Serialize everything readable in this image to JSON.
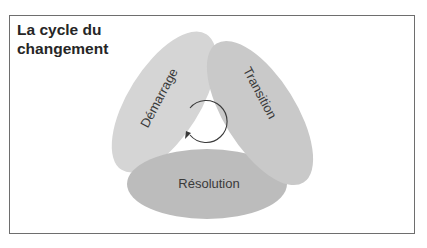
{
  "title": {
    "line1": "La cycle du",
    "line2": "changement"
  },
  "diagram": {
    "phases": [
      {
        "label": "Démarrage",
        "color": "#d5d5d5"
      },
      {
        "label": "Transition",
        "color": "#c9c9c9"
      },
      {
        "label": "Résolution",
        "color": "#bcbcbc"
      }
    ],
    "center_icon": "clockwise-cycle-arrow-icon",
    "line_color": "#3a3a3a",
    "frame_color": "#6e6e6e"
  }
}
